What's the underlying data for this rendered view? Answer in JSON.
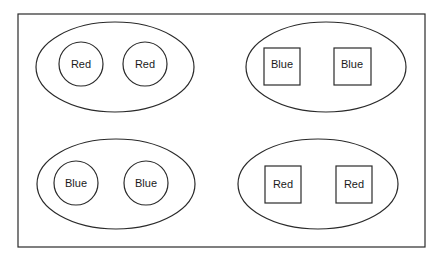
{
  "diagram": {
    "frame": {
      "x": 18,
      "y": 14,
      "width": 407,
      "height": 233
    },
    "groups": [
      {
        "id": "top-left",
        "ellipse": {
          "cx": 115,
          "cy": 67,
          "rx": 79,
          "ry": 45
        },
        "shape": "circle",
        "items": [
          {
            "label": "Red",
            "cx": 81,
            "cy": 64,
            "r": 22
          },
          {
            "label": "Red",
            "cx": 145,
            "cy": 64,
            "r": 22
          }
        ]
      },
      {
        "id": "top-right",
        "ellipse": {
          "cx": 326,
          "cy": 67,
          "rx": 80,
          "ry": 45
        },
        "shape": "square",
        "items": [
          {
            "label": "Blue",
            "x": 264,
            "y": 48,
            "w": 36,
            "h": 37
          },
          {
            "label": "Blue",
            "x": 334,
            "y": 48,
            "w": 37,
            "h": 37
          }
        ]
      },
      {
        "id": "bottom-left",
        "ellipse": {
          "cx": 116,
          "cy": 184,
          "rx": 79,
          "ry": 45
        },
        "shape": "circle",
        "items": [
          {
            "label": "Blue",
            "cx": 76,
            "cy": 183,
            "r": 22
          },
          {
            "label": "Blue",
            "cx": 146,
            "cy": 183,
            "r": 22
          }
        ]
      },
      {
        "id": "bottom-right",
        "ellipse": {
          "cx": 318,
          "cy": 184,
          "rx": 80,
          "ry": 45
        },
        "shape": "square",
        "items": [
          {
            "label": "Red",
            "x": 265,
            "y": 166,
            "w": 36,
            "h": 37
          },
          {
            "label": "Red",
            "x": 336,
            "y": 166,
            "w": 36,
            "h": 37
          }
        ]
      }
    ]
  }
}
